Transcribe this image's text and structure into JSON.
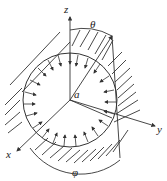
{
  "diagram": {
    "labels": {
      "z": "z",
      "theta": "θ",
      "a": "a",
      "y": "y",
      "x": "x",
      "phi": "φ"
    },
    "colors": {
      "stroke": "#333333",
      "background": "#ffffff"
    }
  }
}
